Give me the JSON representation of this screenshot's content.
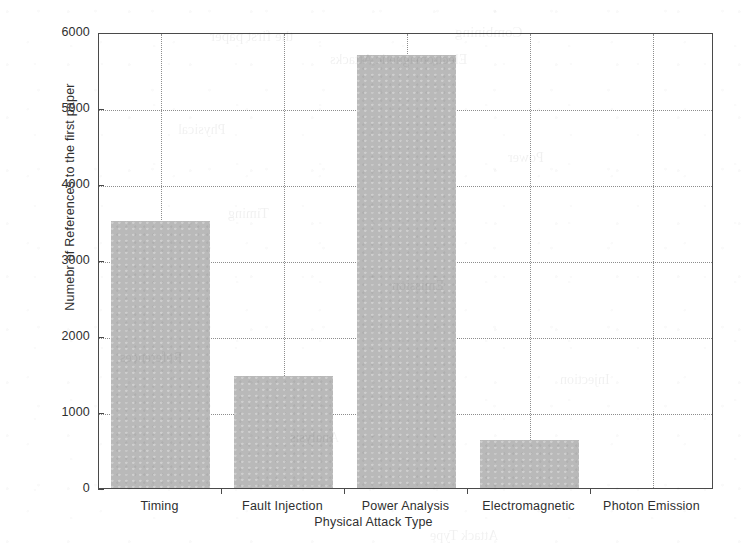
{
  "chart_data": {
    "type": "bar",
    "title": "",
    "subtitle": "",
    "xlabel": "Physical Attack Type",
    "ylabel": "Numebr of References to the first paper",
    "categories": [
      "Timing",
      "Fault Injection",
      "Power Analysis",
      "Electromagnetic",
      "Photon Emission"
    ],
    "values": [
      3510,
      1470,
      5700,
      630,
      0
    ],
    "ylim": [
      0,
      6000
    ],
    "ytick_labels": [
      "0",
      "1000",
      "2000",
      "3000",
      "4000",
      "5000",
      "6000"
    ],
    "ytick_values": [
      0,
      1000,
      2000,
      3000,
      4000,
      5000,
      6000
    ],
    "grid": "dotted-both-axes",
    "legend": "none",
    "bar_color": "#b9b9b9",
    "axis_color": "#4a4a4a",
    "grid_color": "#8d8d8d"
  },
  "ghost_text": [
    {
      "text": "the first paper",
      "x": 210,
      "y": 28,
      "size": 15
    },
    {
      "text": "Combining",
      "x": 455,
      "y": 24,
      "size": 15
    },
    {
      "text": "Electromagnetic Attacks",
      "x": 330,
      "y": 52,
      "size": 14
    },
    {
      "text": "Physical",
      "x": 178,
      "y": 122,
      "size": 14
    },
    {
      "text": "Power",
      "x": 508,
      "y": 150,
      "size": 14
    },
    {
      "text": "Timing",
      "x": 228,
      "y": 206,
      "size": 14
    },
    {
      "text": "Emission",
      "x": 392,
      "y": 278,
      "size": 14
    },
    {
      "text": "References",
      "x": 120,
      "y": 350,
      "size": 14
    },
    {
      "text": "Injection",
      "x": 560,
      "y": 372,
      "size": 14
    },
    {
      "text": "Analysis",
      "x": 290,
      "y": 430,
      "size": 14
    },
    {
      "text": "Attack Type",
      "x": 430,
      "y": 528,
      "size": 14
    }
  ]
}
